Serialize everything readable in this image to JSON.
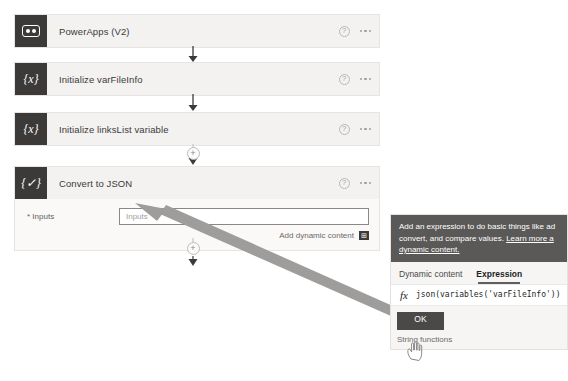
{
  "flow": {
    "steps": [
      {
        "id": "powerapps",
        "title": "PowerApps (V2)",
        "icon": "powerapps-icon"
      },
      {
        "id": "init-varfileinfo",
        "title": "Initialize varFileInfo",
        "icon": "variable-braces-icon"
      },
      {
        "id": "init-linkslist",
        "title": "Initialize linksList variable",
        "icon": "variable-braces-icon"
      },
      {
        "id": "convert-to-json",
        "title": "Convert to JSON",
        "icon": "compose-braces-icon"
      }
    ],
    "help_icon_label": "?",
    "add_step_label": "+"
  },
  "convert_card": {
    "inputs_label": "* Inputs",
    "inputs_value": "",
    "inputs_placeholder": "Inputs",
    "add_dynamic_content_label": "Add dynamic content",
    "add_dynamic_content_icon": "⊞"
  },
  "expression_popup": {
    "header_text": "Add an expression to do basic things like ad convert, and compare values. ",
    "header_link_text": "Learn more a dynamic content.",
    "tabs": [
      {
        "id": "dynamic-content",
        "label": "Dynamic content",
        "active": false
      },
      {
        "id": "expression",
        "label": "Expression",
        "active": true
      }
    ],
    "fx_icon": "fx",
    "expression_value": "json(variables('varFileInfo'))",
    "ok_label": "OK",
    "functions_group_label": "String functions"
  },
  "colors": {
    "card_bg": "#f3f2f1",
    "icon_bg": "#3b3a39",
    "popup_header_bg": "#5a5957",
    "annotation_arrow": "#9e9d9b"
  }
}
